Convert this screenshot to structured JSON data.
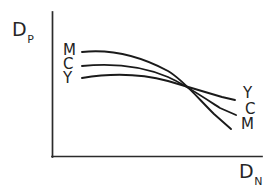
{
  "figure": {
    "background_color": "#ffffff",
    "ink_color": "#1a1a1a",
    "axis_color": "#2b2b2b"
  },
  "axes": {
    "y": {
      "base": "D",
      "subscript": "P",
      "full": "DP"
    },
    "x": {
      "base": "D",
      "subscript": "N",
      "full": "DN"
    }
  },
  "labels": {
    "left": [
      {
        "text": "M",
        "x": 63,
        "y": 43
      },
      {
        "text": "C",
        "x": 63,
        "y": 57
      },
      {
        "text": "Y",
        "x": 63,
        "y": 71
      }
    ],
    "right": [
      {
        "text": "Y",
        "x": 243,
        "y": 86
      },
      {
        "text": "C",
        "x": 245,
        "y": 102
      },
      {
        "text": "M",
        "x": 241,
        "y": 117
      }
    ]
  },
  "chart_data": {
    "type": "line",
    "title": "",
    "xlabel": "DN",
    "ylabel": "DP",
    "grid": false,
    "legend": "inline-endpoint-labels",
    "axis_style": "open-L-axes-no-ticks",
    "sketch_style": "hand-drawn",
    "xlim": [
      0,
      1
    ],
    "ylim": [
      0,
      1
    ],
    "note": "Three density curves (M, C, Y) starting high-left in order M>C>Y, converging near x=0.65 and fanning out reversed Y>C>M toward the right.",
    "series": [
      {
        "name": "M",
        "color": "#1a1a1a",
        "start_label": "M",
        "end_label": "M",
        "x": [
          0.14,
          0.3,
          0.45,
          0.58,
          0.65,
          0.75,
          0.85,
          0.87
        ],
        "y": [
          0.73,
          0.7,
          0.65,
          0.57,
          0.48,
          0.33,
          0.18,
          0.15
        ],
        "path": "M 82,52 C 110,49 140,56 168,71 C 182,79 196,96 214,114 L 231,129"
      },
      {
        "name": "C",
        "color": "#1a1a1a",
        "start_label": "C",
        "end_label": "C",
        "x": [
          0.14,
          0.3,
          0.45,
          0.58,
          0.65,
          0.78,
          0.88,
          0.9
        ],
        "y": [
          0.63,
          0.62,
          0.59,
          0.53,
          0.48,
          0.36,
          0.26,
          0.24
        ],
        "path": "M 82,66 C 112,63 142,66 168,77 C 182,83 200,95 220,108 L 236,115"
      },
      {
        "name": "Y",
        "color": "#1a1a1a",
        "start_label": "Y",
        "end_label": "Y",
        "x": [
          0.14,
          0.3,
          0.45,
          0.58,
          0.65,
          0.78,
          0.88,
          0.9
        ],
        "y": [
          0.55,
          0.56,
          0.55,
          0.51,
          0.48,
          0.41,
          0.35,
          0.34
        ],
        "path": "M 82,78 C 112,73 142,74 168,81 C 182,85 202,91 222,97 L 235,100"
      }
    ],
    "crossing_point": {
      "x": 0.65,
      "y": 0.48,
      "px": 189,
      "py": 88
    }
  },
  "geometry": {
    "width": 278,
    "height": 187,
    "origin": {
      "x": 52,
      "y": 157
    },
    "y_axis_top": 12,
    "x_axis_right": 262
  }
}
